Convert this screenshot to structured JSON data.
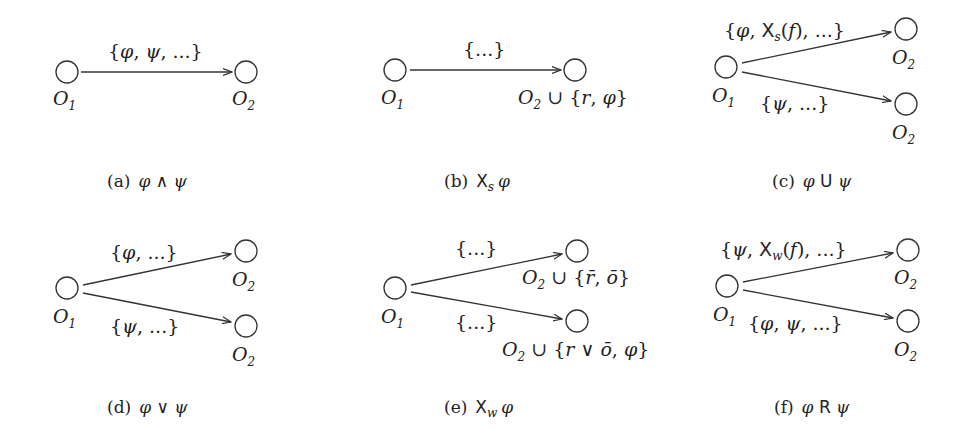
{
  "figure": {
    "panels": [
      {
        "id": "a",
        "caption_tag": "(a)",
        "caption_formula": "φ ∧ ψ",
        "source_node": "O1",
        "edges": [
          {
            "label": "{φ, ψ, ...}",
            "target_label": "O2"
          }
        ]
      },
      {
        "id": "b",
        "caption_tag": "(b)",
        "caption_formula": "Xs φ",
        "source_node": "O1",
        "edges": [
          {
            "label": "{...}",
            "target_label": "O2 ∪ {r, φ}"
          }
        ]
      },
      {
        "id": "c",
        "caption_tag": "(c)",
        "caption_formula": "φ U ψ",
        "source_node": "O1",
        "edges": [
          {
            "label": "{φ, Xs(f), ...}",
            "target_label": "O2"
          },
          {
            "label": "{ψ, ...}",
            "target_label": "O2"
          }
        ]
      },
      {
        "id": "d",
        "caption_tag": "(d)",
        "caption_formula": "φ ∨ ψ",
        "source_node": "O1",
        "edges": [
          {
            "label": "{φ, ...}",
            "target_label": "O2"
          },
          {
            "label": "{ψ, ...}",
            "target_label": "O2"
          }
        ]
      },
      {
        "id": "e",
        "caption_tag": "(e)",
        "caption_formula": "Xw φ",
        "source_node": "O1",
        "edges": [
          {
            "label": "{...}",
            "target_label": "O2 ∪ {r̄, ō}"
          },
          {
            "label": "{...}",
            "target_label": "O2 ∪ {r ∨ ō, φ}"
          }
        ]
      },
      {
        "id": "f",
        "caption_tag": "(f)",
        "caption_formula": "φ R ψ",
        "source_node": "O1",
        "edges": [
          {
            "label": "{ψ, Xw(f), ...}",
            "target_label": "O2"
          },
          {
            "label": "{φ, ψ, ...}",
            "target_label": "O2"
          }
        ]
      }
    ]
  }
}
